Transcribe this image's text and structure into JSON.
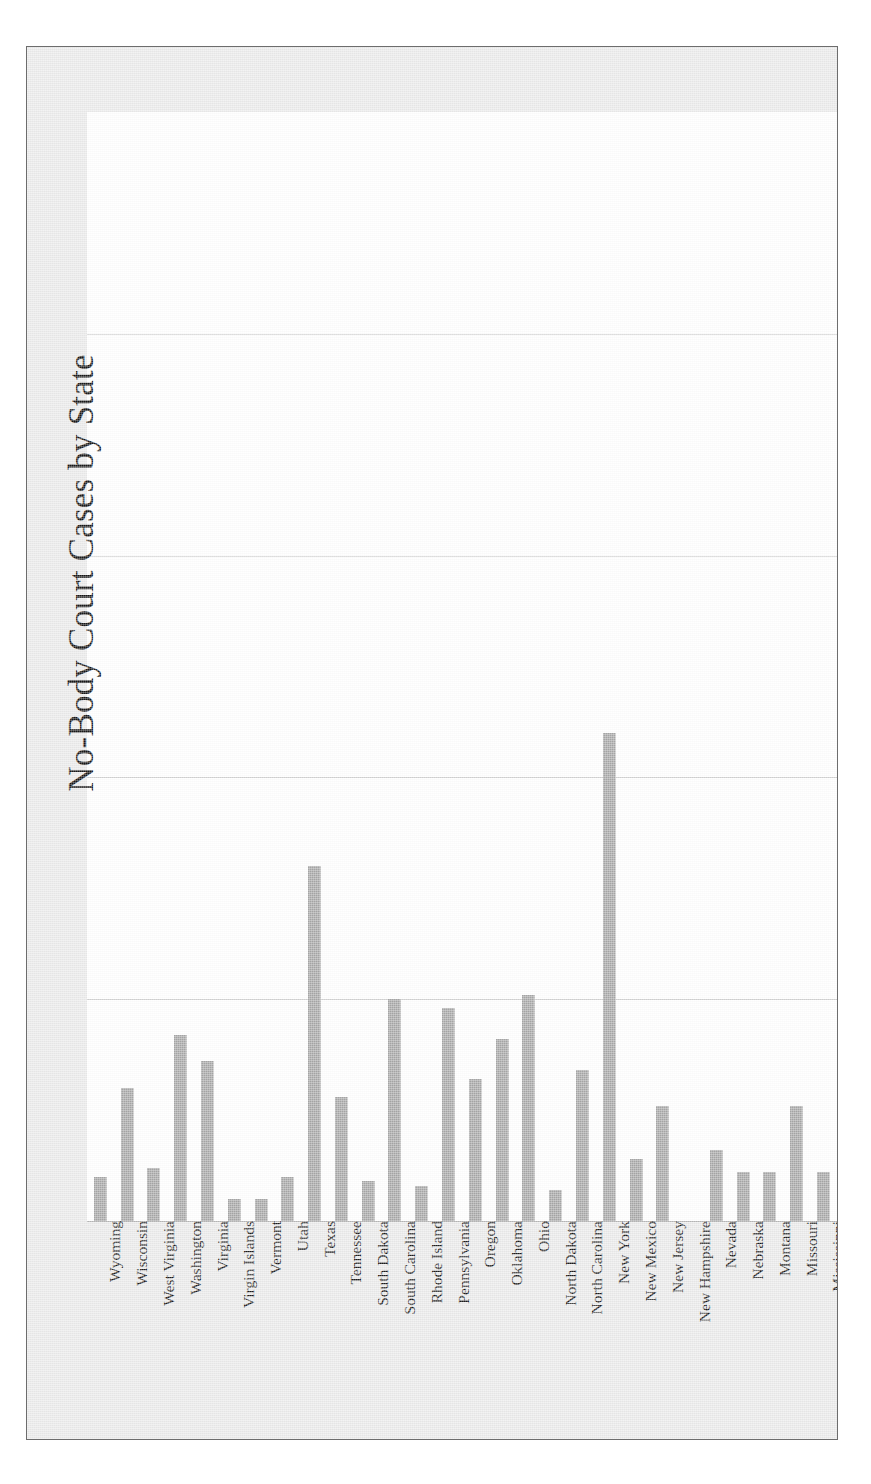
{
  "chart_data": {
    "type": "bar",
    "title": "No-Body Court Cases by State",
    "xlabel": "",
    "ylabel": "",
    "orientation": "vertical",
    "grid": true,
    "gridlines_visible": 4,
    "legend": null,
    "axis_tick_labels": [],
    "ylim": [
      0,
      25
    ],
    "bar_color": "#a8a8a8",
    "plot_background": "#ffffff",
    "frame_background": "#ebebeb",
    "frame_border_color": "#6d6d6d",
    "gridline_color": "#d2d2d2",
    "axis_line_color": "#3a3a3a",
    "categories": [
      "Wyoming",
      "Wisconsin",
      "West Virginia",
      "Washington",
      "Virginia",
      "Virgin Islands",
      "Vermont",
      "Utah",
      "Texas",
      "Tennessee",
      "South Dakota",
      "South Carolina",
      "Rhode Island",
      "Pennsylvania",
      "Oregon",
      "Oklahoma",
      "Ohio",
      "North Dakota",
      "North Carolina",
      "New York",
      "New Mexico",
      "New Jersey",
      "New Hampshire",
      "Nevada",
      "Nebraska",
      "Montana",
      "Missouri",
      "Mississippi"
    ],
    "values": [
      1,
      3,
      1.2,
      4.2,
      3.6,
      0.5,
      0.5,
      1,
      8,
      2.8,
      0.9,
      5,
      0.8,
      4.8,
      3.2,
      4.1,
      5.1,
      0.7,
      3.4,
      11,
      1.4,
      2.6,
      0,
      1.6,
      1.1,
      1.1,
      2.6,
      1.1
    ]
  },
  "meta": {
    "title": "No-Body Court Cases by State"
  }
}
